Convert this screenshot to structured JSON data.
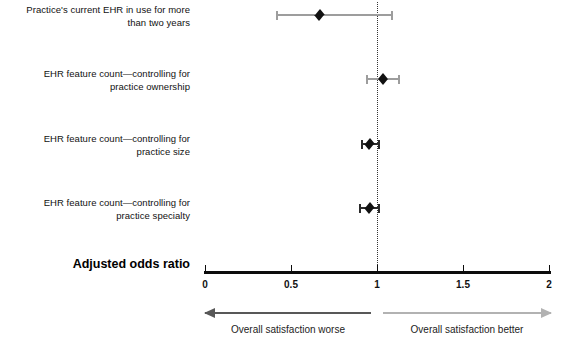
{
  "chart_data": {
    "type": "scatter",
    "title": "",
    "xlabel": "Adjusted odds ratio",
    "ylabel": "",
    "xlim": [
      0,
      2
    ],
    "grid": false,
    "reference_line": 1,
    "tick_labels": [
      "0",
      "0.5",
      "1",
      "1.5",
      "2"
    ],
    "tick_values": [
      0,
      0.5,
      1,
      1.5,
      2
    ],
    "categories": [
      "Practice's current EHR in use for more than two years",
      "EHR feature count—controlling for practice ownership",
      "EHR feature count—controlling for practice size",
      "EHR feature count—controlling for practice specialty"
    ],
    "points": [
      {
        "label_line1": "Practice's current EHR in use for more",
        "label_line2": "than two years",
        "estimate": 0.67,
        "ci_low": 0.42,
        "ci_high": 1.09,
        "marker": "diamond",
        "ci_color": "#9d9d9d"
      },
      {
        "label_line1": "EHR feature count—controlling for",
        "label_line2": "practice ownership",
        "estimate": 1.04,
        "ci_low": 0.94,
        "ci_high": 1.13,
        "marker": "diamond",
        "ci_color": "#9d9d9d"
      },
      {
        "label_line1": "EHR feature count—controlling for",
        "label_line2": "practice size",
        "estimate": 0.96,
        "ci_low": 0.91,
        "ci_high": 1.01,
        "marker": "diamond",
        "ci_color": "#2b2b2b"
      },
      {
        "label_line1": "EHR feature count—controlling for",
        "label_line2": "practice specialty",
        "estimate": 0.96,
        "ci_low": 0.9,
        "ci_high": 1.01,
        "marker": "diamond",
        "ci_color": "#2b2b2b"
      }
    ],
    "annotations": [
      {
        "text": "Overall satisfaction worse",
        "direction": "left",
        "from": 1,
        "to": 0,
        "color": "#585858"
      },
      {
        "text": "Overall satisfaction better",
        "direction": "right",
        "from": 1,
        "to": 2,
        "color": "#b2b2b2"
      }
    ]
  },
  "axis": {
    "title": "Adjusted odds ratio"
  },
  "labels": {
    "row0_line1": "Practice's current EHR in use for more",
    "row0_line2": "than two years",
    "row1_line1": "EHR feature count—controlling for",
    "row1_line2": "practice ownership",
    "row2_line1": "EHR feature count—controlling for",
    "row2_line2": "practice size",
    "row3_line1": "EHR feature count—controlling for",
    "row3_line2": "practice specialty"
  },
  "ticks": {
    "t0": "0",
    "t1": "0.5",
    "t2": "1",
    "t3": "1.5",
    "t4": "2"
  },
  "direction": {
    "worse": "Overall satisfaction worse",
    "better": "Overall satisfaction better"
  },
  "colors": {
    "axis": "#0c0c0c",
    "marker": "#111111",
    "ci_light": "#9d9d9d",
    "ci_dark": "#2b2b2b",
    "arrow_worse": "#585858",
    "arrow_better": "#b2b2b2"
  }
}
